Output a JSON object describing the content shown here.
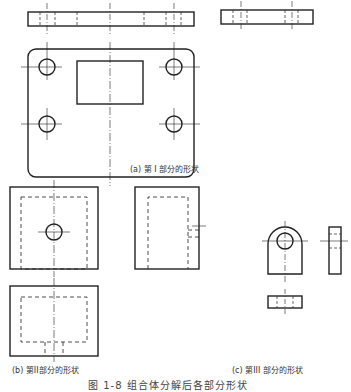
{
  "figure": {
    "caption": "图 1-8  组合体分解后各部分形状",
    "line_color": "#222222",
    "background": "#ffffff"
  },
  "parts": [
    {
      "id": "a",
      "label": "(a) 第 I 部分的形状",
      "description": "base plate: front view, side view, top view with four holes and a rectangular opening"
    },
    {
      "id": "b",
      "label": "(b) 第II部分的形状",
      "description": "rectangular block with hidden cavity: front view, side view, top view"
    },
    {
      "id": "c",
      "label": "(c) 第III 部分的形状",
      "description": "lug with hole: front view, side view, top view"
    }
  ]
}
